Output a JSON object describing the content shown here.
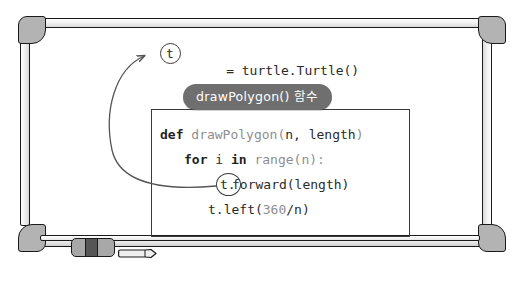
{
  "scene": {
    "type": "whiteboard-illustration",
    "background": "#ffffff",
    "board_border_color": "#1a1a1a",
    "frame_corner_color": "#b3b3b3"
  },
  "callout": {
    "label": "drawPolygon() 함수",
    "pill_color": "#6f6f6f",
    "text_color": "#ffffff"
  },
  "code": {
    "assign": {
      "var": "t",
      "rest": "= turtle.Turtle()"
    },
    "def": {
      "keyword": "def",
      "name": " drawPolygon(",
      "params": "n, length",
      "close": ")"
    },
    "for": {
      "kw_for": "for",
      "var": " i ",
      "kw_in": "in",
      "iter": " range(n):"
    },
    "forward": {
      "receiver": "t.",
      "call": "forward(length)"
    },
    "left": {
      "prefix": "t.left(",
      "number": "360",
      "suffix": "/n)"
    }
  },
  "annotations": {
    "arrow_color": "#555555",
    "circle_color": "#3a3a3a",
    "arrow_description": "curved arrow from t.forward receiver to t assignment"
  },
  "tray_objects": {
    "eraser": {
      "body_color": "#a8a8a8",
      "band_color": "#565656"
    },
    "marker": {
      "body_color": "#f0f0f0",
      "tip_color": "#d6d6d6"
    }
  }
}
